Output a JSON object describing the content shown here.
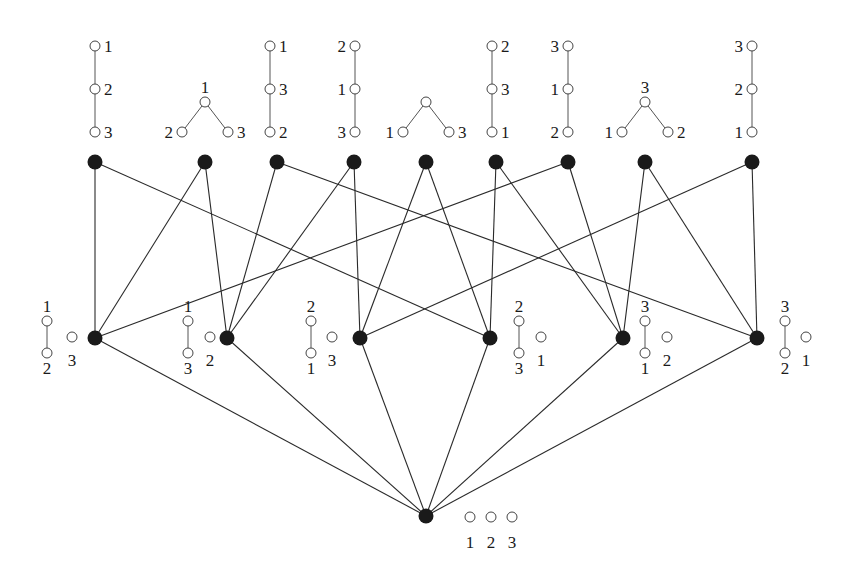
{
  "diagram": {
    "title": "",
    "top_row": [
      {
        "id": "T0",
        "x": 95,
        "glyph": {
          "type": "chain",
          "labels": [
            "1",
            "2",
            "3"
          ],
          "label_side": "right",
          "cx": 95
        }
      },
      {
        "id": "T1",
        "x": 205,
        "glyph": {
          "type": "vee",
          "top": "1",
          "left": "2",
          "right": "3",
          "cx": 205
        }
      },
      {
        "id": "T2",
        "x": 277,
        "glyph": {
          "type": "chain",
          "labels": [
            "1",
            "3",
            "2"
          ],
          "label_side": "right",
          "cx": 270
        }
      },
      {
        "id": "T3",
        "x": 354,
        "glyph": {
          "type": "chain",
          "labels": [
            "2",
            "1",
            "3"
          ],
          "label_side": "left",
          "cx": 355
        }
      },
      {
        "id": "T4",
        "x": 426,
        "glyph": {
          "type": "vee",
          "top": "",
          "left": "1",
          "right": "3",
          "cx": 426
        }
      },
      {
        "id": "T5",
        "x": 496,
        "glyph": {
          "type": "chain",
          "labels": [
            "2",
            "3",
            "1"
          ],
          "label_side": "right",
          "cx": 492
        }
      },
      {
        "id": "T6",
        "x": 568,
        "glyph": {
          "type": "chain",
          "labels": [
            "3",
            "1",
            "2"
          ],
          "label_side": "left",
          "cx": 568
        }
      },
      {
        "id": "T7",
        "x": 645,
        "glyph": {
          "type": "vee",
          "top": "3",
          "left": "1",
          "right": "2",
          "cx": 645
        }
      },
      {
        "id": "T8",
        "x": 752,
        "glyph": {
          "type": "chain",
          "labels": [
            "3",
            "2",
            "1"
          ],
          "label_side": "left",
          "cx": 752
        }
      }
    ],
    "middle_row": [
      {
        "id": "M0",
        "x": 95,
        "glyph": {
          "pair_top": "1",
          "pair_bottom": "2",
          "single": "3",
          "pair_x": 47,
          "single_x": 72
        }
      },
      {
        "id": "M1",
        "x": 227,
        "glyph": {
          "pair_top": "1",
          "pair_bottom": "3",
          "single": "2",
          "pair_x": 188,
          "single_x": 210
        }
      },
      {
        "id": "M2",
        "x": 360,
        "glyph": {
          "pair_top": "2",
          "pair_bottom": "1",
          "single": "3",
          "pair_x": 311,
          "single_x": 332
        }
      },
      {
        "id": "M3",
        "x": 490,
        "glyph": {
          "pair_top": "2",
          "pair_bottom": "3",
          "single": "1",
          "pair_x": 519,
          "single_x": 541
        }
      },
      {
        "id": "M4",
        "x": 623,
        "glyph": {
          "pair_top": "3",
          "pair_bottom": "1",
          "single": "2",
          "pair_x": 645,
          "single_x": 667
        }
      },
      {
        "id": "M5",
        "x": 757,
        "glyph": {
          "pair_top": "3",
          "pair_bottom": "2",
          "single": "1",
          "pair_x": 785,
          "single_x": 806
        }
      }
    ],
    "bottom": {
      "id": "B",
      "x": 426,
      "y": 516,
      "labels": [
        "1",
        "2",
        "3"
      ]
    },
    "edges_top_middle": [
      [
        "T0",
        "M0"
      ],
      [
        "T0",
        "M3"
      ],
      [
        "T1",
        "M0"
      ],
      [
        "T1",
        "M1"
      ],
      [
        "T2",
        "M1"
      ],
      [
        "T2",
        "M5"
      ],
      [
        "T3",
        "M1"
      ],
      [
        "T3",
        "M2"
      ],
      [
        "T4",
        "M2"
      ],
      [
        "T4",
        "M3"
      ],
      [
        "T5",
        "M3"
      ],
      [
        "T5",
        "M4"
      ],
      [
        "T6",
        "M0"
      ],
      [
        "T6",
        "M4"
      ],
      [
        "T7",
        "M4"
      ],
      [
        "T7",
        "M5"
      ],
      [
        "T8",
        "M2"
      ],
      [
        "T8",
        "M5"
      ]
    ],
    "edges_middle_bottom": [
      [
        "M0",
        "B"
      ],
      [
        "M1",
        "B"
      ],
      [
        "M2",
        "B"
      ],
      [
        "M3",
        "B"
      ],
      [
        "M4",
        "B"
      ],
      [
        "M5",
        "B"
      ]
    ],
    "colors": {
      "node_fill": "#1a1a1a",
      "edge": "#2a2a2a",
      "background": "#ffffff"
    }
  }
}
